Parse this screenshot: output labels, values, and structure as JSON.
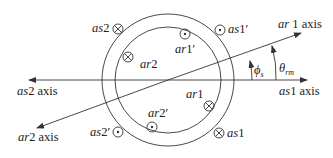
{
  "diagram": {
    "axes": {
      "as1": {
        "label_var": "as",
        "label_num": "1",
        "label_suffix": " axis"
      },
      "as2": {
        "label_var": "as",
        "label_num": "2",
        "label_suffix": " axis"
      },
      "ar1": {
        "label_var": "ar",
        "label_num": " 1",
        "label_suffix": " axis"
      },
      "ar2": {
        "label_var": "ar",
        "label_num": "2",
        "label_suffix": " axis"
      }
    },
    "angles": {
      "phi_s": {
        "symbol": "ϕ",
        "sub": "s"
      },
      "theta_rm": {
        "symbol": "θ",
        "sub": "rm"
      }
    },
    "conductors": {
      "as2": {
        "var": "as",
        "num": "2",
        "prime": "",
        "symbol": "cross"
      },
      "as1p": {
        "var": "as",
        "num": "1",
        "prime": "′",
        "symbol": "dot"
      },
      "ar2c": {
        "var": "",
        "num": "",
        "prime": "",
        "symbol": "cross"
      },
      "ar1p": {
        "var": "ar",
        "num": "1",
        "prime": "′",
        "symbol": "dot"
      },
      "ar1c": {
        "var": "",
        "num": "",
        "prime": "",
        "symbol": "cross"
      },
      "ar2p": {
        "var": "ar",
        "num": "2",
        "prime": "′",
        "symbol": "dot"
      },
      "as2p": {
        "var": "as",
        "num": "2",
        "prime": "′",
        "symbol": "dot"
      },
      "as1": {
        "var": "as",
        "num": "1",
        "prime": "",
        "symbol": "cross"
      }
    },
    "region_labels": {
      "ar2": {
        "var": "ar",
        "num": "2"
      },
      "ar1": {
        "var": "ar",
        "num": "1"
      }
    }
  }
}
